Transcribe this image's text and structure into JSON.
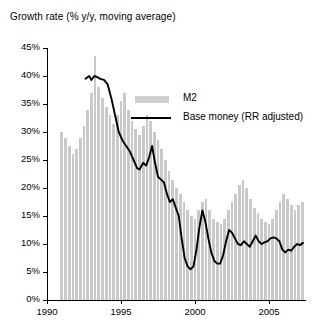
{
  "chart_data": {
    "type": "bar",
    "title": "Growth rate (% y/y, moving average)",
    "xlabel": "",
    "ylabel": "",
    "ylim": [
      0,
      45
    ],
    "xlim": [
      1990,
      2007.5
    ],
    "ytick_values": [
      0,
      5,
      10,
      15,
      20,
      25,
      30,
      35,
      40,
      45
    ],
    "ytick_labels": [
      "0%",
      "5%",
      "10%",
      "15%",
      "20%",
      "25%",
      "30%",
      "35%",
      "40%",
      "45%"
    ],
    "xtick_values": [
      1990,
      1995,
      2000,
      2005
    ],
    "xtick_labels": [
      "1990",
      "1995",
      "2000",
      "2005"
    ],
    "grid": false,
    "legend_position": "top-right",
    "colors": {
      "m2_bars": "#c9c9c9",
      "base_money_line": "#000000",
      "axis": "#000000",
      "background": "#ffffff"
    },
    "series": [
      {
        "name": "M2",
        "type": "bar",
        "color": "#c9c9c9",
        "x": [
          1991.0,
          1991.25,
          1991.5,
          1991.75,
          1992.0,
          1992.25,
          1992.5,
          1992.75,
          1993.0,
          1993.25,
          1993.5,
          1993.75,
          1994.0,
          1994.25,
          1994.5,
          1994.75,
          1995.0,
          1995.25,
          1995.5,
          1995.75,
          1996.0,
          1996.25,
          1996.5,
          1996.75,
          1997.0,
          1997.25,
          1997.5,
          1997.75,
          1998.0,
          1998.25,
          1998.5,
          1998.75,
          1999.0,
          1999.25,
          1999.5,
          1999.75,
          2000.0,
          2000.25,
          2000.5,
          2000.75,
          2001.0,
          2001.25,
          2001.5,
          2001.75,
          2002.0,
          2002.25,
          2002.5,
          2002.75,
          2003.0,
          2003.25,
          2003.5,
          2003.75,
          2004.0,
          2004.25,
          2004.5,
          2004.75,
          2005.0,
          2005.25,
          2005.5,
          2005.75,
          2006.0,
          2006.25,
          2006.5,
          2006.75,
          2007.0,
          2007.25
        ],
        "values": [
          30.0,
          29.0,
          27.5,
          26.0,
          27.0,
          29.0,
          31.0,
          34.0,
          37.0,
          43.5,
          38.0,
          36.0,
          34.5,
          33.0,
          31.5,
          33.0,
          35.5,
          37.0,
          34.0,
          32.0,
          30.5,
          29.5,
          31.0,
          33.0,
          32.0,
          30.0,
          28.5,
          27.0,
          25.0,
          23.0,
          21.5,
          20.0,
          19.0,
          17.5,
          16.0,
          15.0,
          14.5,
          16.0,
          17.5,
          18.0,
          16.0,
          14.5,
          14.0,
          13.5,
          14.5,
          16.0,
          17.5,
          19.0,
          20.5,
          21.5,
          20.0,
          18.0,
          16.5,
          15.5,
          14.5,
          14.0,
          13.5,
          14.5,
          16.0,
          17.5,
          19.0,
          18.0,
          17.0,
          16.0,
          17.0,
          17.5
        ]
      },
      {
        "name": "Base money (RR adjusted)",
        "type": "line",
        "color": "#000000",
        "x": [
          1992.6,
          1992.85,
          1993.0,
          1993.2,
          1993.4,
          1993.6,
          1993.85,
          1994.1,
          1994.35,
          1994.6,
          1994.85,
          1995.1,
          1995.35,
          1995.6,
          1995.85,
          1996.1,
          1996.25,
          1996.5,
          1996.7,
          1996.9,
          1997.1,
          1997.3,
          1997.5,
          1997.7,
          1997.9,
          1998.1,
          1998.3,
          1998.5,
          1998.7,
          1998.9,
          1999.1,
          1999.3,
          1999.5,
          1999.7,
          1999.9,
          2000.1,
          2000.3,
          2000.5,
          2000.7,
          2000.9,
          2001.1,
          2001.3,
          2001.5,
          2001.7,
          2001.9,
          2002.1,
          2002.3,
          2002.5,
          2002.7,
          2002.9,
          2003.1,
          2003.3,
          2003.5,
          2003.7,
          2003.9,
          2004.1,
          2004.3,
          2004.5,
          2004.7,
          2004.9,
          2005.1,
          2005.3,
          2005.5,
          2005.7,
          2005.9,
          2006.1,
          2006.3,
          2006.5,
          2006.7,
          2006.9,
          2007.1,
          2007.3
        ],
        "values": [
          39.5,
          40.0,
          39.3,
          40.0,
          39.8,
          39.5,
          39.3,
          38.5,
          36.0,
          33.0,
          30.0,
          28.5,
          27.5,
          26.5,
          25.0,
          23.5,
          23.3,
          24.5,
          24.0,
          25.5,
          27.5,
          24.5,
          22.0,
          21.5,
          21.0,
          19.0,
          17.5,
          18.0,
          16.5,
          15.0,
          11.0,
          7.5,
          6.0,
          5.5,
          6.0,
          9.0,
          13.0,
          16.0,
          14.0,
          11.0,
          8.5,
          7.0,
          6.5,
          6.5,
          8.0,
          10.5,
          12.5,
          12.0,
          11.0,
          10.0,
          9.8,
          10.5,
          10.0,
          9.5,
          10.5,
          11.5,
          10.5,
          10.0,
          10.3,
          10.5,
          11.0,
          11.2,
          11.0,
          10.5,
          9.0,
          8.5,
          9.0,
          8.8,
          9.5,
          10.0,
          9.8,
          10.2
        ]
      }
    ],
    "legend": [
      {
        "label": "M2",
        "marker": "bar",
        "color": "#c9c9c9"
      },
      {
        "label": "Base money (RR adjusted)",
        "marker": "line",
        "color": "#000000"
      }
    ]
  }
}
